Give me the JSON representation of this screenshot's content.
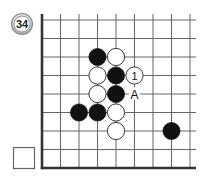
{
  "problem": {
    "number": "34",
    "answer_box_label": ""
  },
  "board": {
    "columns": 9,
    "rows": 9,
    "edges": [
      "left",
      "bottom"
    ],
    "line_color": "#555555",
    "edge_color": "#333333",
    "black_color": "#111111",
    "white_color": "#ffffff"
  },
  "stones": [
    {
      "color": "black",
      "col": 3,
      "row": 2,
      "label": ""
    },
    {
      "color": "white",
      "col": 4,
      "row": 2,
      "label": ""
    },
    {
      "color": "white",
      "col": 3,
      "row": 3,
      "label": ""
    },
    {
      "color": "black",
      "col": 4,
      "row": 3,
      "label": ""
    },
    {
      "color": "white",
      "col": 5,
      "row": 3,
      "label": "1"
    },
    {
      "color": "white",
      "col": 3,
      "row": 4,
      "label": ""
    },
    {
      "color": "black",
      "col": 4,
      "row": 4,
      "label": ""
    },
    {
      "color": "black",
      "col": 2,
      "row": 5,
      "label": ""
    },
    {
      "color": "black",
      "col": 3,
      "row": 5,
      "label": ""
    },
    {
      "color": "white",
      "col": 4,
      "row": 5,
      "label": ""
    },
    {
      "color": "white",
      "col": 4,
      "row": 6,
      "label": ""
    },
    {
      "color": "black",
      "col": 7,
      "row": 6,
      "label": ""
    }
  ],
  "markers": [
    {
      "label": "A",
      "col": 5,
      "row": 4
    }
  ]
}
